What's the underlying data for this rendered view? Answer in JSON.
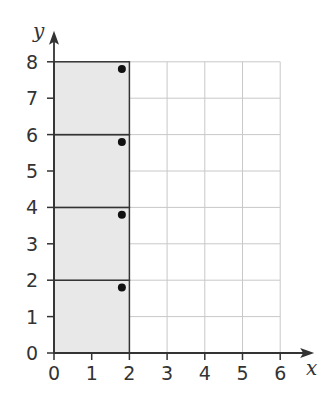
{
  "chart_data": {
    "type": "scatter",
    "title": "",
    "xlabel": "x",
    "ylabel": "y",
    "xlim": [
      0,
      6
    ],
    "ylim": [
      0,
      8
    ],
    "x_ticks": [
      "0",
      "1",
      "2",
      "3",
      "4",
      "5",
      "6"
    ],
    "y_ticks": [
      "0",
      "1",
      "2",
      "3",
      "4",
      "5",
      "6",
      "7",
      "8"
    ],
    "grid": true,
    "shaded_rectangles": [
      {
        "x": [
          0,
          2
        ],
        "y": [
          0,
          2
        ]
      },
      {
        "x": [
          0,
          2
        ],
        "y": [
          2,
          4
        ]
      },
      {
        "x": [
          0,
          2
        ],
        "y": [
          4,
          6
        ]
      },
      {
        "x": [
          0,
          2
        ],
        "y": [
          6,
          8
        ]
      }
    ],
    "points": [
      {
        "x": 1.8,
        "y": 1.8
      },
      {
        "x": 1.8,
        "y": 3.8
      },
      {
        "x": 1.8,
        "y": 5.8
      },
      {
        "x": 1.8,
        "y": 7.8
      }
    ],
    "colors": {
      "shade": "#e8e8e8",
      "grid": "#c8c8c8",
      "axis": "#333333",
      "point": "#111111"
    }
  }
}
